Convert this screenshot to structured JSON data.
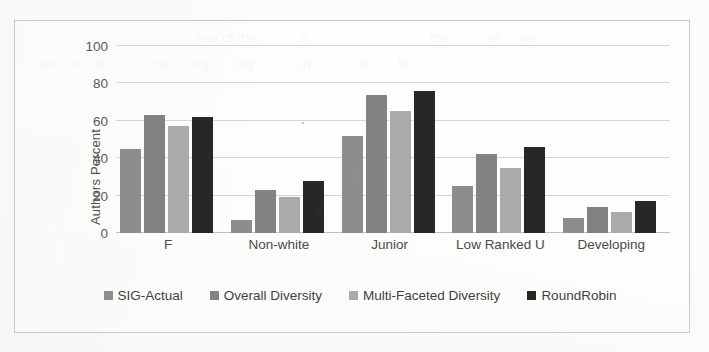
{
  "chart_data": {
    "type": "bar",
    "title": "",
    "subtitle": "",
    "xlabel": "",
    "ylabel": "Authors Percent",
    "ylim": [
      0,
      100
    ],
    "ytick_labels": [
      "100",
      "80",
      "60",
      "40",
      "20",
      "0"
    ],
    "ytick_values": [
      100,
      80,
      60,
      40,
      20,
      0
    ],
    "grid": "horizontal",
    "legend_position": "bottom",
    "categories": [
      "F",
      "Non-white",
      "Junior",
      "Low Ranked U",
      "Developing"
    ],
    "series": [
      {
        "name": "SIG-Actual",
        "color": "#8d8d8d",
        "values": [
          45,
          7,
          52,
          25,
          8
        ]
      },
      {
        "name": "Overall Diversity",
        "color": "#828282",
        "values": [
          63,
          23,
          74,
          42,
          14
        ]
      },
      {
        "name": "Multi-Faceted Diversity",
        "color": "#aaaaaa",
        "values": [
          57,
          19,
          65,
          35,
          11
        ]
      },
      {
        "name": "RoundRobin",
        "color": "#272727",
        "values": [
          62,
          28,
          76,
          46,
          17
        ]
      }
    ]
  },
  "axis": {
    "y_title": "Authors Percent"
  },
  "legend": {
    "items": [
      {
        "label": "SIG-Actual",
        "color": "#8d8d8d"
      },
      {
        "label": "Overall Diversity",
        "color": "#828282"
      },
      {
        "label": "Multi-Faceted Diversity",
        "color": "#aaaaaa"
      },
      {
        "label": "RoundRobin",
        "color": "#272727"
      }
    ]
  },
  "background_text": [
    {
      "text": "nce of the",
      "x": 196,
      "y": 30
    },
    {
      "text": "a",
      "x": 300,
      "y": 30
    },
    {
      "text": "the",
      "x": 430,
      "y": 30
    },
    {
      "text": "of",
      "x": 488,
      "y": 30
    },
    {
      "text": "he",
      "x": 520,
      "y": 30
    },
    {
      "text": "ow",
      "x": 36,
      "y": 56
    },
    {
      "text": "ro",
      "x": 72,
      "y": 56
    },
    {
      "text": "lin",
      "x": 95,
      "y": 56
    },
    {
      "text": "rov",
      "x": 150,
      "y": 56
    },
    {
      "text": "ing",
      "x": 190,
      "y": 56
    },
    {
      "text": "ag",
      "x": 238,
      "y": 56
    },
    {
      "text": "sp",
      "x": 300,
      "y": 56
    },
    {
      "text": "ro",
      "x": 360,
      "y": 56
    },
    {
      "text": "lin",
      "x": 398,
      "y": 56
    }
  ]
}
